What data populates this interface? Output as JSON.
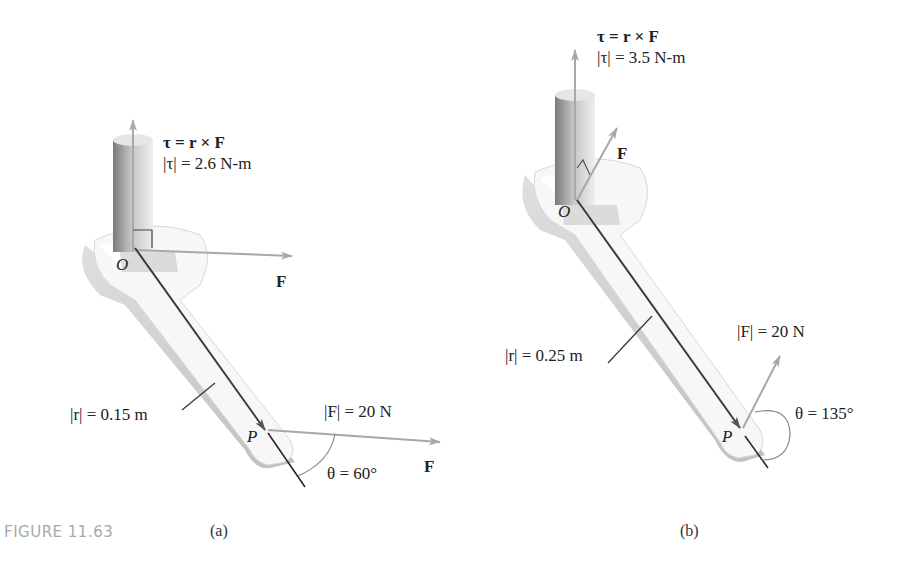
{
  "figure": {
    "caption": "FIGURE 11.63",
    "panels": [
      {
        "id": "a",
        "label": "(a)",
        "torque_eq": "τ = r × F",
        "torque_mag": "|τ| = 2.6 N-m",
        "origin": "O",
        "point": "P",
        "force_label_top": "F",
        "r_mag": "|r| = 0.15 m",
        "F_mag": "|F| = 20 N",
        "force_label_bottom": "F",
        "theta": "θ = 60°"
      },
      {
        "id": "b",
        "label": "(b)",
        "torque_eq": "τ = r × F",
        "torque_mag": "|τ| = 3.5 N-m",
        "origin": "O",
        "point": "P",
        "force_label_top": "F",
        "r_mag": "|r| = 0.25 m",
        "F_mag": "|F| = 20 N",
        "theta": "θ = 135°"
      }
    ]
  },
  "colors": {
    "vector_gray": "#a8a8a8",
    "line_dark": "#3a3a3a",
    "caption_gray": "#a9a9a9"
  }
}
